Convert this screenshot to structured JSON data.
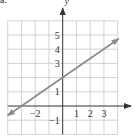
{
  "figure": {
    "part_label": "a.",
    "x_axis_label": "x",
    "y_axis_label": "y"
  },
  "chart_data": {
    "type": "line",
    "title": "",
    "xlabel": "x",
    "ylabel": "y",
    "xlim": [
      -4,
      4
    ],
    "ylim": [
      -2,
      6
    ],
    "grid": true,
    "grid_step": 1,
    "x_tick_labels": [
      "-2",
      "1",
      "2",
      "3"
    ],
    "x_tick_values": [
      -2,
      1,
      2,
      3
    ],
    "y_tick_labels": [
      "-1",
      "1",
      "3",
      "4",
      "5"
    ],
    "y_tick_values": [
      -1,
      1,
      3,
      4,
      5
    ],
    "series": [
      {
        "name": "y = (2/3)x + 2",
        "equation": "y = (2/3)x + 2",
        "slope": 0.6667,
        "y_intercept": 2,
        "x_intercept": -3,
        "x": [
          -4,
          -3,
          0,
          4
        ],
        "y": [
          -0.67,
          0,
          2,
          4.67
        ],
        "arrows_both_ends": true,
        "color": "#8a8a8a"
      }
    ]
  },
  "style": {
    "grid_color": "#c8c8c8",
    "axis_color": "#333333",
    "line_color": "#8a8a8a",
    "text_color": "#333333"
  }
}
